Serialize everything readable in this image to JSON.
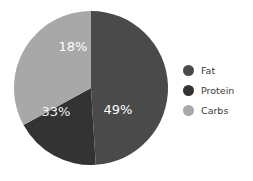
{
  "chart_data": {
    "type": "pie",
    "title": "",
    "categories": [
      "Fat",
      "Protein",
      "Carbs"
    ],
    "values": [
      49,
      18,
      33
    ],
    "value_labels": [
      "49%",
      "18%",
      "33%"
    ],
    "units": "percent",
    "start_angle_deg": 0,
    "direction": "clockwise",
    "colors": [
      "#4a4a4a",
      "#333333",
      "#a8a8a8"
    ],
    "legend_position": "right",
    "grid": false,
    "xlabel": "",
    "ylabel": "",
    "slices": [
      {
        "name": "Fat",
        "value": 49,
        "label": "49%",
        "color": "#4a4a4a",
        "label_color": "#ffffff",
        "label_x": 118,
        "label_y": 110
      },
      {
        "name": "Protein",
        "value": 18,
        "label": "18%",
        "color": "#333333",
        "label_color": "#ffffff",
        "label_x": 73,
        "label_y": 47
      },
      {
        "name": "Carbs",
        "value": 33,
        "label": "33%",
        "color": "#a8a8a8",
        "label_color": "#f2f2f2",
        "label_x": 56,
        "label_y": 112
      }
    ],
    "geometry": {
      "center_x": 91,
      "center_y": 88,
      "radius": 77
    }
  },
  "legend": {
    "items": [
      {
        "label": "Fat",
        "color": "#4a4a4a"
      },
      {
        "label": "Protein",
        "color": "#333333"
      },
      {
        "label": "Carbs",
        "color": "#a8a8a8"
      }
    ]
  },
  "background": "#ffffff"
}
